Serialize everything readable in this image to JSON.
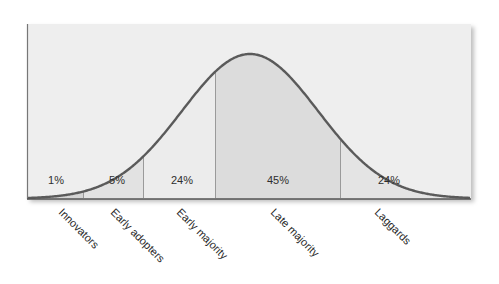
{
  "chart_data": {
    "type": "area",
    "title": "",
    "xlabel": "",
    "ylabel": "",
    "grid": false,
    "legend": "none",
    "segments": [
      {
        "name": "Innovators",
        "share_label": "1%",
        "share": 1,
        "fill": "#d4d4d4"
      },
      {
        "name": "Early adopters",
        "share_label": "5%",
        "share": 5,
        "fill": "#e2e2e2"
      },
      {
        "name": "Early majority",
        "share_label": "24%",
        "share": 24,
        "fill": "#ececec"
      },
      {
        "name": "Late majority",
        "share_label": "45%",
        "share": 45,
        "fill": "#dcdcdc"
      },
      {
        "name": "Laggards",
        "share_label": "24%",
        "share": 24,
        "fill": "#e4e4e4"
      }
    ],
    "colors": {
      "background": "#eeeeee",
      "curve": "#5a5a5a",
      "divider": "#9a9a9a",
      "axis": "#555555"
    }
  }
}
